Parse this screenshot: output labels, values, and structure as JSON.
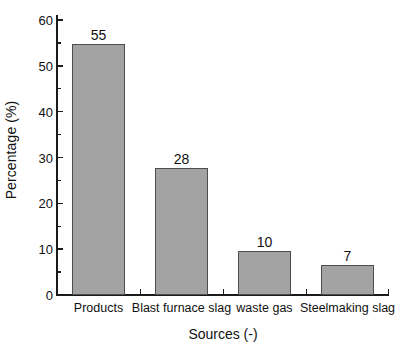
{
  "chart_data": {
    "type": "bar",
    "title": "",
    "subtitle": "",
    "xlabel": "Sources (-)",
    "ylabel": "Percentage (%)",
    "categories": [
      "Products",
      "Blast furnace slag",
      "waste gas",
      "Steelmaking slag"
    ],
    "values": [
      55,
      28,
      10,
      7
    ],
    "bar_heights": [
      54.8,
      27.7,
      9.7,
      6.6
    ],
    "data_labels": [
      "55",
      "28",
      "10",
      "7"
    ],
    "ylim": [
      0,
      60
    ],
    "xlim": [
      0,
      4
    ],
    "y_major_ticks": [
      0,
      10,
      20,
      30,
      40,
      50,
      60
    ],
    "y_tick_labels": [
      "0",
      "10",
      "20",
      "30",
      "40",
      "50",
      "60"
    ],
    "y_minor_ticks": [
      5,
      15,
      25,
      35,
      45,
      55
    ],
    "grid": false,
    "legend": null,
    "legend_position": "none",
    "series": [
      {
        "name": "Percentage",
        "values": [
          55,
          28,
          10,
          7
        ]
      }
    ],
    "colors": {
      "bar_fill": "#a3a3a3",
      "bar_edge": "#4d4d4d",
      "axis": "#1a1a1a",
      "text": "#111111",
      "background": "#ffffff"
    },
    "spines": [
      "left",
      "bottom"
    ],
    "tick_direction": "in"
  }
}
